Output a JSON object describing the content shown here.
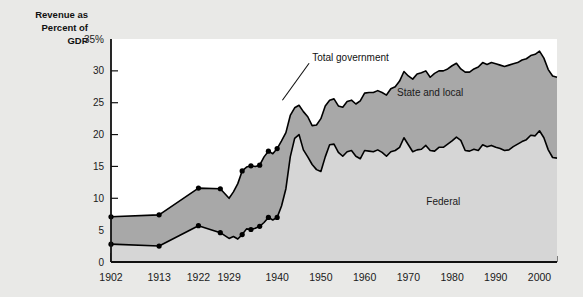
{
  "chart_data": {
    "type": "area",
    "title": "",
    "ylabel": "Revenue as Percent of GDP",
    "xlabel": "",
    "ylim": [
      0,
      35
    ],
    "xlim": [
      1902,
      2004
    ],
    "grid": false,
    "legend_position": "inline-annotations",
    "ytick_labels": [
      "0",
      "5",
      "10",
      "15",
      "20",
      "25",
      "30",
      "35%"
    ],
    "ytick_values": [
      0,
      5,
      10,
      15,
      20,
      25,
      30,
      35
    ],
    "xtick_labels": [
      "1902",
      "1913",
      "1922",
      "1929",
      "1940",
      "1950",
      "1960",
      "1970",
      "1980",
      "1990",
      "2000"
    ],
    "xtick_values": [
      1902,
      1913,
      1922,
      1929,
      1940,
      1950,
      1960,
      1970,
      1980,
      1990,
      2000
    ],
    "annotations": [
      {
        "text": "Total government",
        "x": 1948,
        "y": 31.5
      },
      {
        "text": "State and local",
        "x": 1975,
        "y": 26.0
      },
      {
        "text": "Federal",
        "x": 1978,
        "y": 9.0
      }
    ],
    "colors": {
      "state_and_local_band": "#a8a8a8",
      "federal_band": "#d6d6d6",
      "line": "#000000",
      "plot_background": "#ffffff",
      "page_background": "#e9e9e7"
    },
    "marker_years": [
      1902,
      1913,
      1922,
      1927,
      1932,
      1934,
      1936,
      1938,
      1940
    ],
    "series": [
      {
        "name": "Total government",
        "x": [
          1902,
          1913,
          1922,
          1927,
          1929,
          1930,
          1931,
          1932,
          1933,
          1934,
          1935,
          1936,
          1937,
          1938,
          1939,
          1940,
          1941,
          1942,
          1943,
          1944,
          1945,
          1946,
          1947,
          1948,
          1949,
          1950,
          1951,
          1952,
          1953,
          1954,
          1955,
          1956,
          1957,
          1958,
          1959,
          1960,
          1961,
          1962,
          1963,
          1964,
          1965,
          1966,
          1967,
          1968,
          1969,
          1970,
          1971,
          1972,
          1973,
          1974,
          1975,
          1976,
          1977,
          1978,
          1979,
          1980,
          1981,
          1982,
          1983,
          1984,
          1985,
          1986,
          1987,
          1988,
          1989,
          1990,
          1991,
          1992,
          1993,
          1994,
          1995,
          1996,
          1997,
          1998,
          1999,
          2000,
          2001,
          2002,
          2003,
          2004
        ],
        "values": [
          7.1,
          7.4,
          11.6,
          11.5,
          10.0,
          11.0,
          12.3,
          14.3,
          14.9,
          15.1,
          15.0,
          15.2,
          16.5,
          17.4,
          17.0,
          17.8,
          19.0,
          20.3,
          23.0,
          24.2,
          24.6,
          23.6,
          22.8,
          21.4,
          21.5,
          22.5,
          24.5,
          25.4,
          25.6,
          24.5,
          24.3,
          25.2,
          25.4,
          24.8,
          25.3,
          26.5,
          26.6,
          26.6,
          26.9,
          26.6,
          26.2,
          27.2,
          27.5,
          28.4,
          29.9,
          29.2,
          28.7,
          29.5,
          29.7,
          30.0,
          29.0,
          29.6,
          30.0,
          30.0,
          30.3,
          30.8,
          31.2,
          30.3,
          29.8,
          29.8,
          30.3,
          30.6,
          31.3,
          31.0,
          31.3,
          31.1,
          30.9,
          30.7,
          30.9,
          31.1,
          31.3,
          31.7,
          31.9,
          32.4,
          32.6,
          33.1,
          32.0,
          30.2,
          29.2,
          29.0
        ]
      },
      {
        "name": "Federal",
        "x": [
          1902,
          1913,
          1922,
          1927,
          1929,
          1930,
          1931,
          1932,
          1933,
          1934,
          1935,
          1936,
          1937,
          1938,
          1939,
          1940,
          1941,
          1942,
          1943,
          1944,
          1945,
          1946,
          1947,
          1948,
          1949,
          1950,
          1951,
          1952,
          1953,
          1954,
          1955,
          1956,
          1957,
          1958,
          1959,
          1960,
          1961,
          1962,
          1963,
          1964,
          1965,
          1966,
          1967,
          1968,
          1969,
          1970,
          1971,
          1972,
          1973,
          1974,
          1975,
          1976,
          1977,
          1978,
          1979,
          1980,
          1981,
          1982,
          1983,
          1984,
          1985,
          1986,
          1987,
          1988,
          1989,
          1990,
          1991,
          1992,
          1993,
          1994,
          1995,
          1996,
          1997,
          1998,
          1999,
          2000,
          2001,
          2002,
          2003,
          2004
        ],
        "values": [
          2.8,
          2.5,
          5.7,
          4.6,
          3.7,
          4.0,
          3.6,
          4.3,
          5.2,
          5.1,
          5.3,
          5.6,
          6.2,
          7.0,
          6.6,
          7.0,
          8.8,
          11.5,
          16.5,
          19.4,
          20.0,
          17.6,
          16.5,
          15.3,
          14.5,
          14.2,
          16.5,
          18.4,
          18.5,
          17.2,
          16.6,
          17.3,
          17.5,
          16.6,
          16.2,
          17.5,
          17.4,
          17.3,
          17.6,
          17.2,
          16.6,
          17.3,
          17.5,
          18.0,
          19.5,
          18.4,
          17.3,
          17.6,
          17.7,
          18.3,
          17.5,
          17.4,
          18.0,
          18.0,
          18.5,
          19.0,
          19.6,
          19.1,
          17.5,
          17.4,
          17.7,
          17.5,
          18.4,
          18.1,
          18.3,
          18.0,
          17.8,
          17.5,
          17.6,
          18.1,
          18.5,
          18.9,
          19.2,
          19.9,
          19.8,
          20.6,
          19.5,
          17.6,
          16.4,
          16.3
        ]
      }
    ]
  },
  "axis": {
    "title_line1": "Revenue as",
    "title_line2": "Percent of",
    "title_line3": "GDP"
  }
}
